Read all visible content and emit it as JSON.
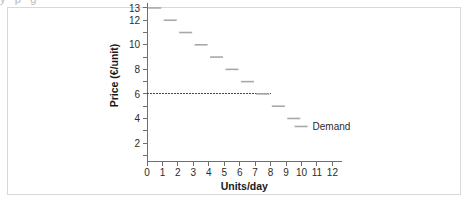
{
  "figure": {
    "clipped_text_above": "y  p  g"
  },
  "chart_data": {
    "type": "line",
    "title": "",
    "xlabel": "Units/day",
    "ylabel": "Price (€/unit)",
    "xlim": [
      0,
      12.6
    ],
    "ylim": [
      0,
      13.6
    ],
    "xticks": [
      0,
      1,
      2,
      3,
      4,
      5,
      6,
      7,
      8,
      9,
      10,
      11,
      12
    ],
    "xtick_labels": [
      "0",
      "1",
      "2",
      "3",
      "4",
      "5",
      "6",
      "7",
      "8",
      "9",
      "10",
      "11",
      "12"
    ],
    "yticks": [
      1,
      2,
      3,
      4,
      5,
      6,
      7,
      8,
      9,
      10,
      11,
      12,
      13
    ],
    "ytick_labels": [
      "",
      "2",
      "",
      "4",
      "",
      "6",
      "",
      "8",
      "",
      "10",
      "",
      "12",
      "13"
    ],
    "grid": false,
    "legend_position": "inside-right",
    "series": [
      {
        "name": "Demand",
        "style": "step-segments",
        "color": "#a8a8a8",
        "steps": [
          {
            "x_start": 0,
            "x_end": 1,
            "price": 13
          },
          {
            "x_start": 1,
            "x_end": 2,
            "price": 12
          },
          {
            "x_start": 2,
            "x_end": 3,
            "price": 11
          },
          {
            "x_start": 3,
            "x_end": 4,
            "price": 10
          },
          {
            "x_start": 4,
            "x_end": 5,
            "price": 9
          },
          {
            "x_start": 5,
            "x_end": 6,
            "price": 8
          },
          {
            "x_start": 6,
            "x_end": 7,
            "price": 7
          },
          {
            "x_start": 7,
            "x_end": 8,
            "price": 6
          },
          {
            "x_start": 8,
            "x_end": 9,
            "price": 5
          },
          {
            "x_start": 9,
            "x_end": 10,
            "price": 4
          }
        ]
      }
    ],
    "annotations": [
      {
        "type": "horizontal-dashed-line",
        "label": "",
        "y_value": 6,
        "x_start": 0,
        "x_end": 8,
        "color": "#4b4b4b"
      }
    ],
    "legend": [
      {
        "label": "Demand",
        "color": "#a8a8a8"
      }
    ]
  }
}
